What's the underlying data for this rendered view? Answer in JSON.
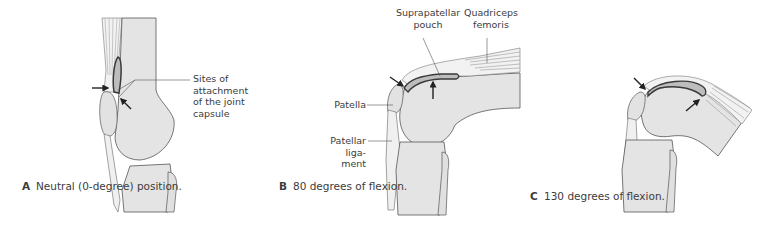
{
  "figure": {
    "panels": [
      {
        "id": "A",
        "letter": "A",
        "caption": "Neutral\n(0-degree)\nposition.",
        "labels": {
          "capsule": "Sites of\nattachment\nof the joint\ncapsule"
        }
      },
      {
        "id": "B",
        "letter": "B",
        "caption": "80 degrees\nof flexion.",
        "labels": {
          "suprapatellar": "Suprapatellar\npouch",
          "quadriceps": "Quadriceps\nfemoris",
          "patella": "Patella",
          "patellar_ligament": "Patellar\nliga-\nment"
        }
      },
      {
        "id": "C",
        "letter": "C",
        "caption": "130 degrees\nof flexion."
      }
    ],
    "colors": {
      "bone_fill": "#e4e4e4",
      "outline": "#555555",
      "pouch": "#4a4a4a",
      "tendon": "#f0f0f0",
      "muscle_lines": "#8a8a8a",
      "arrow": "#222222",
      "leader": "#555555"
    }
  }
}
